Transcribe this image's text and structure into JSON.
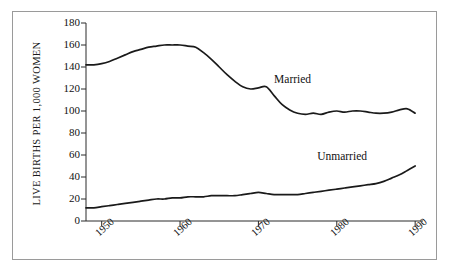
{
  "chart_data": {
    "type": "line",
    "title": "",
    "xlabel": "",
    "ylabel": "LIVE BIRTHS PER 1,000 WOMEN",
    "xlim": [
      1948,
      1991
    ],
    "ylim": [
      0,
      180
    ],
    "grid": false,
    "legend_position": "inline-annotation",
    "yticks": [
      0,
      20,
      40,
      60,
      80,
      100,
      120,
      140,
      160,
      180
    ],
    "ytick_labels": [
      "0",
      "20",
      "40",
      "60",
      "80",
      "100",
      "120",
      "140",
      "160",
      "180"
    ],
    "xticks": [
      1950,
      1960,
      1970,
      1980,
      1990
    ],
    "xtick_labels": [
      "1950",
      "1960",
      "1970",
      "1980",
      "1990"
    ],
    "series": [
      {
        "name": "Married",
        "label": "Married",
        "color": "#1a1a1a",
        "label_x": 1972.0,
        "label_y": 128,
        "x": [
          1948,
          1949,
          1950,
          1951,
          1952,
          1953,
          1954,
          1955,
          1956,
          1957,
          1958,
          1959,
          1960,
          1961,
          1962,
          1963,
          1964,
          1965,
          1966,
          1967,
          1968,
          1969,
          1970,
          1971,
          1972,
          1973,
          1974,
          1975,
          1976,
          1977,
          1978,
          1979,
          1980,
          1981,
          1982,
          1983,
          1984,
          1985,
          1986,
          1987,
          1988,
          1989,
          1990
        ],
        "values": [
          142,
          142,
          143,
          145,
          148,
          151,
          154,
          156,
          158,
          159,
          160,
          160,
          160,
          159,
          158,
          153,
          147,
          140,
          133,
          127,
          122,
          120,
          121,
          122,
          114,
          106,
          101,
          98,
          97,
          98,
          97,
          99,
          100,
          99,
          100,
          100,
          99,
          98,
          98,
          99,
          101,
          102,
          98
        ]
      },
      {
        "name": "Unmarried",
        "label": "Unmarried",
        "color": "#1a1a1a",
        "label_x": 1977.5,
        "label_y": 58,
        "x": [
          1948,
          1949,
          1950,
          1951,
          1952,
          1953,
          1954,
          1955,
          1956,
          1957,
          1958,
          1959,
          1960,
          1961,
          1962,
          1963,
          1964,
          1965,
          1966,
          1967,
          1968,
          1969,
          1970,
          1971,
          1972,
          1973,
          1974,
          1975,
          1976,
          1977,
          1978,
          1979,
          1980,
          1981,
          1982,
          1983,
          1984,
          1985,
          1986,
          1987,
          1988,
          1989,
          1990
        ],
        "values": [
          12,
          12,
          13,
          14,
          15,
          16,
          17,
          18,
          19,
          20,
          20,
          21,
          21,
          22,
          22,
          22,
          23,
          23,
          23,
          23,
          24,
          25,
          26,
          25,
          24,
          24,
          24,
          24,
          25,
          26,
          27,
          28,
          29,
          30,
          31,
          32,
          33,
          34,
          36,
          39,
          42,
          46,
          50
        ]
      }
    ]
  }
}
